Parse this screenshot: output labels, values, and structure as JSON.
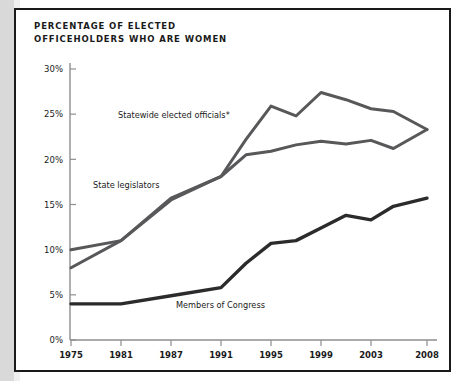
{
  "figure": {
    "title_line1": "PERCENTAGE OF ELECTED",
    "title_line2": "OFFICEHOLDERS WHO ARE WOMEN",
    "title": "PERCENTAGE OF ELECTED\nOFFICEHOLDERS WHO ARE WOMEN",
    "background_color": "#ffffff",
    "border_color": "#1a1a1a",
    "gutter_color": "#d9d9d9"
  },
  "axes": {
    "y_ticks": [
      "0%",
      "5%",
      "10%",
      "15%",
      "20%",
      "25%",
      "30%"
    ],
    "x_ticks": [
      "1975",
      "1981",
      "1987",
      "1991",
      "1995",
      "1999",
      "2003",
      "2008"
    ],
    "axis_color": "#8e8e8e"
  },
  "labels": {
    "statewide": "Statewide elected officials*",
    "legislators": "State legislators",
    "congress": "Members of Congress"
  },
  "chart_data": {
    "type": "line",
    "title": "PERCENTAGE OF ELECTED OFFICEHOLDERS WHO ARE WOMEN",
    "xlabel": "",
    "ylabel": "",
    "ylim": [
      0,
      30
    ],
    "ytick_values": [
      0,
      5,
      10,
      15,
      20,
      25,
      30
    ],
    "ytick_labels": [
      "0%",
      "5%",
      "10%",
      "15%",
      "20%",
      "25%",
      "30%"
    ],
    "xtick_labels": [
      "1975",
      "1981",
      "1987",
      "1991",
      "1995",
      "1999",
      "2003",
      "2008"
    ],
    "grid": false,
    "legend": "inline-annotations",
    "x": [
      1975,
      1981,
      1987,
      1991,
      1993,
      1995,
      1997,
      1999,
      2001,
      2003,
      2005,
      2008
    ],
    "series": [
      {
        "name": "Statewide elected officials*",
        "color": "#58585a",
        "values": [
          10.0,
          11.0,
          15.7,
          18.1,
          22.2,
          25.9,
          24.8,
          27.4,
          26.6,
          25.6,
          25.3,
          23.3
        ]
      },
      {
        "name": "State legislators",
        "color": "#58585a",
        "values": [
          8.0,
          11.0,
          15.5,
          18.1,
          20.5,
          20.9,
          21.6,
          22.0,
          21.7,
          22.1,
          21.2,
          23.3
        ]
      },
      {
        "name": "Members of Congress",
        "color": "#2b2b2b",
        "values": [
          4.0,
          4.0,
          4.9,
          5.8,
          8.5,
          10.7,
          11.0,
          12.4,
          13.8,
          13.3,
          14.8,
          15.7
        ]
      }
    ]
  }
}
